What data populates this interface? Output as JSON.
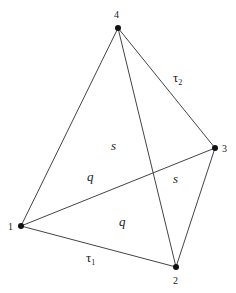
{
  "diagram": {
    "vertices": [
      {
        "id": "1",
        "label": "1",
        "x": 21,
        "y": 226,
        "label_x": 8,
        "label_y": 230
      },
      {
        "id": "2",
        "label": "2",
        "x": 176,
        "label_x": 173,
        "y": 267,
        "label_y": 284
      },
      {
        "id": "3",
        "label": "3",
        "x": 215,
        "y": 148,
        "label_x": 222,
        "label_y": 152
      },
      {
        "id": "4",
        "label": "4",
        "x": 118,
        "y": 28,
        "label_x": 114,
        "label_y": 18
      }
    ],
    "edges": [
      {
        "from": "1",
        "to": "4"
      },
      {
        "from": "1",
        "to": "2"
      },
      {
        "from": "1",
        "to": "3"
      },
      {
        "from": "4",
        "to": "3"
      },
      {
        "from": "4",
        "to": "2"
      },
      {
        "from": "3",
        "to": "2"
      }
    ],
    "edge_labels": [
      {
        "id": "tau2",
        "base": "τ",
        "sub": "2",
        "x": 173,
        "y": 82
      },
      {
        "id": "tau1",
        "base": "τ",
        "sub": "1",
        "x": 86,
        "y": 262
      }
    ],
    "region_labels": [
      {
        "id": "s-upper",
        "text": "s",
        "x": 111,
        "y": 150
      },
      {
        "id": "s-right",
        "text": "s",
        "x": 173,
        "y": 183
      },
      {
        "id": "q-upper",
        "text": "q",
        "x": 87,
        "y": 181
      },
      {
        "id": "q-lower",
        "text": "q",
        "x": 119,
        "y": 226
      }
    ]
  }
}
